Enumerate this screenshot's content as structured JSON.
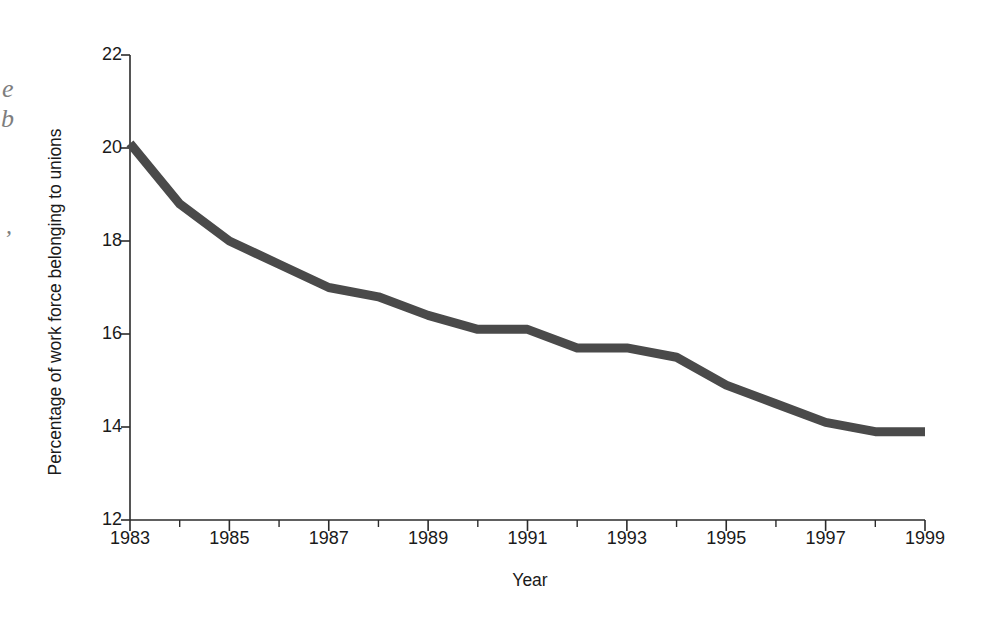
{
  "chart_data": {
    "type": "line",
    "title": "",
    "xlabel": "Year",
    "ylabel": "Percentage of work force belonging to unions",
    "x": [
      1983,
      1984,
      1985,
      1986,
      1987,
      1988,
      1989,
      1990,
      1991,
      1992,
      1993,
      1994,
      1995,
      1996,
      1997,
      1998,
      1999
    ],
    "values": [
      20.1,
      18.8,
      18.0,
      17.5,
      17.0,
      16.8,
      16.4,
      16.1,
      16.1,
      15.7,
      15.7,
      15.5,
      14.9,
      14.5,
      14.1,
      13.9,
      13.9
    ],
    "series": [
      {
        "name": "Union membership",
        "values": [
          20.1,
          18.8,
          18.0,
          17.5,
          17.0,
          16.8,
          16.4,
          16.1,
          16.1,
          15.7,
          15.7,
          15.5,
          14.9,
          14.5,
          14.1,
          13.9,
          13.9
        ]
      }
    ],
    "xlim": [
      1983,
      1999
    ],
    "ylim": [
      12,
      22
    ],
    "xticks": [
      1983,
      1985,
      1987,
      1989,
      1991,
      1993,
      1995,
      1997,
      1999
    ],
    "xtick_labels": [
      "1983",
      "1985",
      "1987",
      "1989",
      "1991",
      "1993",
      "1995",
      "1997",
      "1999"
    ],
    "xminor_ticks": [
      1984,
      1986,
      1988,
      1990,
      1992,
      1994,
      1996,
      1998
    ],
    "yticks": [
      12,
      14,
      16,
      18,
      20,
      22
    ],
    "ytick_labels": [
      "12",
      "14",
      "16",
      "18",
      "20",
      "22"
    ],
    "grid": false,
    "legend": null,
    "legend_position": "none",
    "line_color": "#4a4a4a",
    "axis_color": "#2b2b2b",
    "background_color": "#ffffff",
    "line_width": 9
  },
  "artifacts": {
    "glyph_a": "e",
    "glyph_b": "b",
    "glyph_c": ","
  }
}
